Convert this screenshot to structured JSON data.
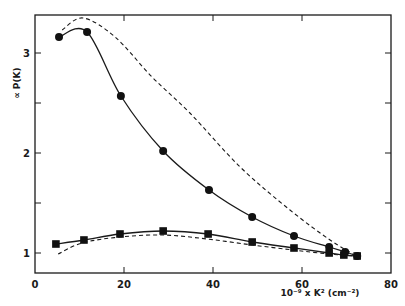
{
  "chart_data": {
    "type": "line",
    "title": "",
    "xlabel": "10⁻⁹ x K² (cm⁻²)",
    "ylabel": "∝ P(K)",
    "xlim": [
      0,
      80
    ],
    "ylim": [
      0.8,
      3.38
    ],
    "x_ticks": [
      0,
      20,
      40,
      60,
      80
    ],
    "x_tick_labels": [
      "0",
      "20",
      "40",
      "60",
      "80"
    ],
    "y_ticks": [
      1,
      1.5,
      2,
      2.5,
      3
    ],
    "y_tick_labels": [
      "1",
      "",
      "2",
      "",
      "3"
    ],
    "grid": false,
    "legend": "none",
    "series": [
      {
        "name": "circles (measured)",
        "marker": "circle",
        "line": "solid",
        "x": [
          5.4,
          11.7,
          19.3,
          28.8,
          39.1,
          48.8,
          58.2,
          66.1,
          69.7,
          72.4
        ],
        "y": [
          3.16,
          3.21,
          2.57,
          2.02,
          1.63,
          1.36,
          1.17,
          1.06,
          1.01,
          0.97
        ]
      },
      {
        "name": "squares (measured)",
        "marker": "square",
        "line": "solid",
        "x": [
          4.7,
          11.0,
          19.1,
          28.8,
          38.9,
          48.8,
          58.2,
          66.1,
          69.4,
          72.4
        ],
        "y": [
          1.09,
          1.13,
          1.19,
          1.22,
          1.19,
          1.11,
          1.05,
          1.0,
          0.98,
          0.97
        ]
      },
      {
        "name": "upper dashed (theory)",
        "marker": "none",
        "line": "dashed",
        "x": [
          6.1,
          10.8,
          18.0,
          26.3,
          34.8,
          46.1,
          57.3,
          66.3,
          71.5
        ],
        "y": [
          3.23,
          3.35,
          3.16,
          2.76,
          2.4,
          1.86,
          1.43,
          1.13,
          0.99
        ]
      },
      {
        "name": "lower dashed (theory)",
        "marker": "none",
        "line": "dashed",
        "x": [
          5.2,
          10.6,
          19.1,
          28.8,
          38.7,
          48.8,
          58.0,
          66.0,
          72.0
        ],
        "y": [
          0.99,
          1.1,
          1.16,
          1.18,
          1.14,
          1.08,
          1.03,
          0.99,
          0.97
        ]
      }
    ]
  }
}
